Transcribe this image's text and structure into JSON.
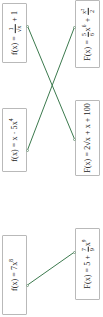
{
  "exercise": {
    "type": "matching",
    "orientation": "rotated-90-ccw",
    "accent_color": "#3c7a4e",
    "box_border_color": "#b9b9b9",
    "text_color": "#1a1a1a"
  },
  "left_column": [
    {
      "id": "left-1",
      "label": "f(x) = 1/√x + 1",
      "lead": "f(x) = ",
      "frac_num": "1",
      "frac_den": "√x",
      "tail": " + 1"
    },
    {
      "id": "left-2",
      "label": "f(x) = x · 5x⁴",
      "text": "f(x) = x · 5x",
      "exp": "4"
    },
    {
      "id": "left-3",
      "label": "f(x) = 7x⁸",
      "text": "f(x) = 7x",
      "exp": "8"
    }
  ],
  "right_column": [
    {
      "id": "right-1",
      "label": "F(x) = 5/6 x⁶ + x²/2",
      "lead": "F(x) = ",
      "frac1_num": "5",
      "frac1_den": "6",
      "mid": "x",
      "mid_exp": "6",
      "plus": " + ",
      "frac2_num": "x²",
      "frac2_den": "2"
    },
    {
      "id": "right-2",
      "label": "F(x) = 2√x + x + 100",
      "text": "F(x) = 2√x + x + 100"
    },
    {
      "id": "right-3",
      "label": "F(x) = 5 + 7/9 x⁹",
      "lead": "F(x) = 5 + ",
      "frac_num": "7",
      "frac_den": "9",
      "tail": "x",
      "tail_exp": "9"
    }
  ],
  "connections": [
    {
      "id": "conn-1",
      "from": "left-1",
      "to": "right-2"
    },
    {
      "id": "conn-2",
      "from": "left-2",
      "to": "right-1"
    },
    {
      "id": "conn-3",
      "from": "left-3",
      "to": "right-3"
    }
  ]
}
